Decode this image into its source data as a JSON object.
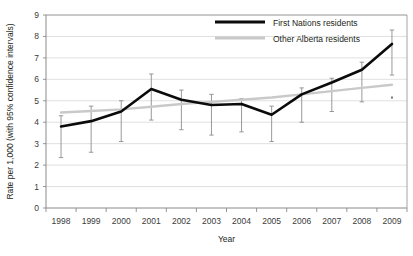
{
  "chart_data": {
    "type": "line",
    "title": "",
    "xlabel": "Year",
    "ylabel": "Rate per 1,000 (with 95% confidence intervals)",
    "categories": [
      "1998",
      "1999",
      "2000",
      "2001",
      "2002",
      "2003",
      "2004",
      "2005",
      "2006",
      "2007",
      "2008",
      "2009"
    ],
    "x": [
      1998,
      1999,
      2000,
      2001,
      2002,
      2003,
      2004,
      2005,
      2006,
      2007,
      2008,
      2009
    ],
    "xlim": [
      1998,
      2009
    ],
    "ylim": [
      0,
      9
    ],
    "yticks": [
      "0",
      "1",
      "2",
      "3",
      "4",
      "5",
      "6",
      "7",
      "8",
      "9"
    ],
    "grid": true,
    "legend_position": "top-center",
    "series": [
      {
        "name": "First Nations residents",
        "color": "#0b0b0b",
        "values": [
          3.8,
          4.05,
          4.5,
          5.55,
          5.05,
          4.8,
          4.85,
          4.35,
          5.3,
          5.85,
          6.45,
          7.65
        ],
        "ci_lower": [
          2.35,
          2.6,
          3.1,
          4.1,
          3.65,
          3.4,
          3.55,
          3.1,
          4.0,
          4.5,
          4.95,
          6.2
        ],
        "ci_upper": [
          4.3,
          4.75,
          5.0,
          6.25,
          5.5,
          5.3,
          5.1,
          4.75,
          5.6,
          6.05,
          6.8,
          8.3
        ]
      },
      {
        "name": "Other Alberta residents",
        "color": "#c9c9c9",
        "values": [
          4.45,
          4.52,
          4.6,
          4.72,
          4.85,
          4.95,
          5.05,
          5.15,
          5.3,
          5.45,
          5.6,
          5.75
        ],
        "ci_lower": [
          null,
          null,
          null,
          null,
          null,
          null,
          null,
          null,
          null,
          null,
          null,
          5.1
        ],
        "ci_upper": [
          null,
          null,
          null,
          null,
          null,
          null,
          null,
          null,
          null,
          null,
          null,
          5.2
        ]
      }
    ]
  },
  "legend": {
    "items": [
      {
        "label": "First Nations residents"
      },
      {
        "label": "Other Alberta residents"
      }
    ]
  }
}
